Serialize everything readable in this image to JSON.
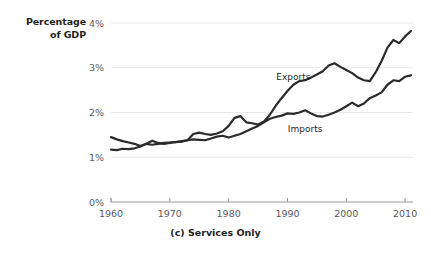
{
  "chart_data": {
    "type": "line",
    "title": "",
    "caption": "(c) Services Only",
    "ylabel_line1": "Percentage",
    "ylabel_line2": "of GDP",
    "xlabel": "",
    "xlim": [
      1960,
      2011
    ],
    "ylim": [
      0,
      4
    ],
    "grid": "horizontal",
    "legend_position": "inline-annotations",
    "ytick_labels": [
      "0%",
      "1%",
      "2%",
      "3%",
      "4%"
    ],
    "ytick_values": [
      0,
      1,
      2,
      3,
      4
    ],
    "xtick_labels": [
      "1960",
      "1970",
      "1980",
      "1990",
      "2000",
      "2010"
    ],
    "xtick_values": [
      1960,
      1970,
      1980,
      1990,
      2000,
      2010
    ],
    "units": "percent of GDP",
    "line_color": "#2b2b2b",
    "grid_color": "#e8e8e8",
    "axis_color": "#9a9a9a",
    "annotations": [
      {
        "text": "Exports",
        "x": 1991,
        "y": 2.72
      },
      {
        "text": "Imports",
        "x": 1993,
        "y": 1.57
      }
    ],
    "x": [
      1960,
      1961,
      1962,
      1963,
      1964,
      1965,
      1966,
      1967,
      1968,
      1969,
      1970,
      1971,
      1972,
      1973,
      1974,
      1975,
      1976,
      1977,
      1978,
      1979,
      1980,
      1981,
      1982,
      1983,
      1984,
      1985,
      1986,
      1987,
      1988,
      1989,
      1990,
      1991,
      1992,
      1993,
      1994,
      1995,
      1996,
      1997,
      1998,
      1999,
      2000,
      2001,
      2002,
      2003,
      2004,
      2005,
      2006,
      2007,
      2008,
      2009,
      2010,
      2011
    ],
    "series": [
      {
        "name": "Exports",
        "values": [
          1.45,
          1.4,
          1.36,
          1.33,
          1.3,
          1.25,
          1.3,
          1.37,
          1.32,
          1.3,
          1.32,
          1.34,
          1.35,
          1.38,
          1.52,
          1.55,
          1.52,
          1.5,
          1.53,
          1.58,
          1.7,
          1.88,
          1.92,
          1.78,
          1.76,
          1.73,
          1.8,
          1.95,
          2.15,
          2.32,
          2.48,
          2.62,
          2.7,
          2.72,
          2.78,
          2.85,
          2.92,
          3.05,
          3.1,
          3.02,
          2.95,
          2.88,
          2.78,
          2.72,
          2.7,
          2.9,
          3.15,
          3.45,
          3.62,
          3.55,
          3.7,
          3.82
        ]
      },
      {
        "name": "Imports",
        "values": [
          1.17,
          1.16,
          1.19,
          1.18,
          1.2,
          1.24,
          1.3,
          1.28,
          1.3,
          1.32,
          1.33,
          1.34,
          1.36,
          1.38,
          1.4,
          1.39,
          1.38,
          1.42,
          1.46,
          1.48,
          1.44,
          1.48,
          1.52,
          1.58,
          1.64,
          1.7,
          1.78,
          1.86,
          1.9,
          1.93,
          1.98,
          1.97,
          2.0,
          2.05,
          1.98,
          1.92,
          1.91,
          1.95,
          2.0,
          2.06,
          2.14,
          2.22,
          2.14,
          2.2,
          2.32,
          2.38,
          2.45,
          2.62,
          2.72,
          2.7,
          2.8,
          2.83
        ]
      }
    ]
  }
}
